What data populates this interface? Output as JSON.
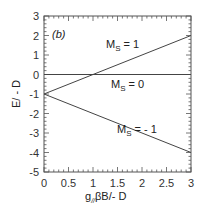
{
  "chart_data": {
    "type": "line",
    "panel_label": "(b)",
    "title": "",
    "xlabel": "g//βB/- D",
    "ylabel": "E/ - D",
    "xlim": [
      0,
      3
    ],
    "ylim": [
      -5,
      3
    ],
    "x_ticks": [
      0,
      0.5,
      1,
      1.5,
      2,
      2.5,
      3
    ],
    "x_tick_labels": [
      "0",
      "0.5",
      "1",
      "1.5",
      "2",
      "2.5",
      "3"
    ],
    "y_ticks": [
      3,
      2,
      1,
      0,
      -1,
      -2,
      -3,
      -4,
      -5
    ],
    "y_tick_labels": [
      "3",
      "2",
      "1",
      "0",
      "-1",
      "-2",
      "-3",
      "-4",
      "-5"
    ],
    "grid": false,
    "legend": "none",
    "series": [
      {
        "name": "M_S = 1",
        "x": [
          0,
          3
        ],
        "y": [
          -1,
          2
        ]
      },
      {
        "name": "M_S = 0",
        "x": [
          0,
          3
        ],
        "y": [
          0,
          0
        ]
      },
      {
        "name": "M_S = -1",
        "x": [
          0,
          3
        ],
        "y": [
          -1,
          -4
        ]
      }
    ],
    "annotations": [
      {
        "text": "M_S = 1",
        "x": 1.2,
        "y": 1.3
      },
      {
        "text": "M_S = 0",
        "x": 1.3,
        "y": -0.9
      },
      {
        "text": "M_S = - 1",
        "x": 1.5,
        "y": -3.1
      }
    ]
  },
  "labels": {
    "panel": "(b)",
    "ms1_main": "M",
    "ms1_sub": "S",
    "ms1_rest": " = 1",
    "ms0_main": "M",
    "ms0_sub": "S",
    "ms0_rest": " = 0",
    "msm1_main": "M",
    "msm1_sub": "S",
    "msm1_rest": " = - 1",
    "xlabel_g": "g",
    "xlabel_sub": "//",
    "xlabel_rest": "βB/- D",
    "ylabel": "E/ - D"
  }
}
